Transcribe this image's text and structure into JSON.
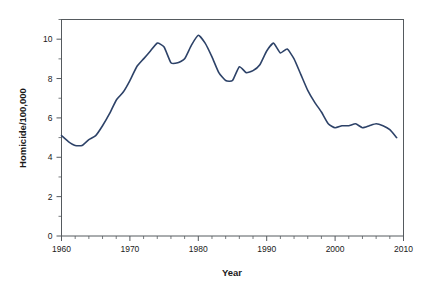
{
  "chart_data": {
    "type": "line",
    "title": "",
    "subtitle": "",
    "xlabel": "Year",
    "ylabel": "Homicide/100,000",
    "xlim": [
      1960,
      2010
    ],
    "ylim": [
      0,
      11
    ],
    "grid": false,
    "legend": null,
    "legend_position": "none",
    "line_color": "#2d4268",
    "axis_color": "#555a5e",
    "text_color": "#1a1a1a",
    "background_color": "#ffffff",
    "x_ticks_major": [
      1960,
      1970,
      1980,
      1990,
      2000,
      2010
    ],
    "x_tick_labels": [
      "1960",
      "1970",
      "1980",
      "1990",
      "2000",
      "2010"
    ],
    "x_tick_minor_step": 2,
    "y_ticks_major": [
      0,
      2,
      4,
      6,
      8,
      10
    ],
    "y_tick_labels": [
      "0",
      "2",
      "4",
      "6",
      "8",
      "10"
    ],
    "y_tick_minor_step": 1,
    "series": [
      {
        "name": "Homicide rate",
        "x": [
          1960,
          1961,
          1962,
          1963,
          1964,
          1965,
          1966,
          1967,
          1968,
          1969,
          1970,
          1971,
          1972,
          1973,
          1974,
          1975,
          1976,
          1977,
          1978,
          1979,
          1980,
          1981,
          1982,
          1983,
          1984,
          1985,
          1986,
          1987,
          1988,
          1989,
          1990,
          1991,
          1992,
          1993,
          1994,
          1995,
          1996,
          1997,
          1998,
          1999,
          2000,
          2001,
          2002,
          2003,
          2004,
          2005,
          2006,
          2007,
          2008,
          2009
        ],
        "values": [
          5.1,
          4.8,
          4.6,
          4.6,
          4.9,
          5.1,
          5.6,
          6.2,
          6.9,
          7.3,
          7.9,
          8.6,
          9.0,
          9.4,
          9.8,
          9.6,
          8.8,
          8.8,
          9.0,
          9.7,
          10.2,
          9.8,
          9.1,
          8.3,
          7.9,
          7.9,
          8.6,
          8.3,
          8.4,
          8.7,
          9.4,
          9.8,
          9.3,
          9.5,
          9.0,
          8.2,
          7.4,
          6.8,
          6.3,
          5.7,
          5.5,
          5.6,
          5.6,
          5.7,
          5.5,
          5.6,
          5.7,
          5.6,
          5.4,
          5.0
        ]
      }
    ]
  },
  "figure": {
    "x_axis_title": "Year",
    "y_axis_title": "Homicide/100,000"
  }
}
